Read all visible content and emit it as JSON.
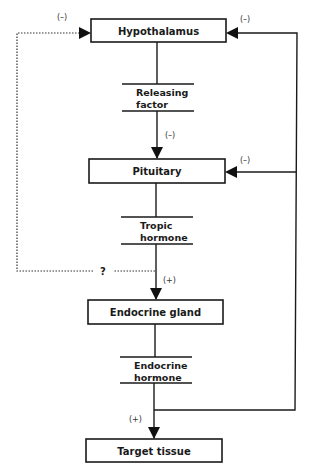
{
  "diagram": {
    "title": "",
    "nodes": [
      {
        "id": "hypothalamus",
        "label": "Hypothalamus"
      },
      {
        "id": "pituitary",
        "label": "Pituitary"
      },
      {
        "id": "endocrine_gland",
        "label": "Endocrine gland"
      },
      {
        "id": "target_tissue",
        "label": "Target tissue"
      }
    ],
    "secretions": [
      {
        "id": "releasing_factor",
        "line1": "Releasing",
        "line2": "factor"
      },
      {
        "id": "tropic_hormone",
        "line1": "Tropic",
        "line2": "hormone"
      },
      {
        "id": "endocrine_hormone",
        "line1": "Endocrine",
        "line2": "hormone"
      }
    ],
    "signs": {
      "hypothalamus_left_feedback": "(–)",
      "hypothalamus_right_feedback": "(–)",
      "releasing_to_pituitary": "(–)",
      "pituitary_right_feedback": "(–)",
      "tropic_to_endocrine": "(+)",
      "endocrine_to_target": "(+)"
    },
    "unknown_marker": "?",
    "edges": [
      {
        "from": "hypothalamus",
        "to": "releasing_factor",
        "style": "solid"
      },
      {
        "from": "releasing_factor",
        "to": "pituitary",
        "style": "solid-arrow",
        "sign": "(–)"
      },
      {
        "from": "pituitary",
        "to": "tropic_hormone",
        "style": "solid"
      },
      {
        "from": "tropic_hormone",
        "to": "endocrine_gland",
        "style": "solid-arrow",
        "sign": "(+)"
      },
      {
        "from": "endocrine_gland",
        "to": "endocrine_hormone",
        "style": "solid"
      },
      {
        "from": "endocrine_hormone",
        "to": "target_tissue",
        "style": "solid-arrow",
        "sign": "(+)"
      },
      {
        "from": "endocrine_hormone",
        "to": "hypothalamus",
        "style": "solid-feedback",
        "sign": "(–)"
      },
      {
        "from": "endocrine_hormone",
        "to": "pituitary",
        "style": "solid-feedback",
        "sign": "(–)"
      },
      {
        "from": "tropic_hormone",
        "to": "hypothalamus",
        "style": "dotted-feedback",
        "sign": "(–)",
        "marker": "?"
      }
    ]
  }
}
